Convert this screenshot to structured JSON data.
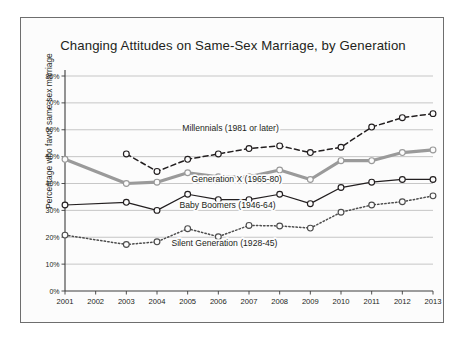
{
  "figure": {
    "title": "Changing Attitudes on Same-Sex Marriage, by Generation",
    "y_axis_title": "Percentage who favor same-sex marriage",
    "frame_color": "#6e6e6e",
    "background": "#fcfcfc"
  },
  "chart_data": {
    "type": "line",
    "title": "Changing Attitudes on Same-Sex Marriage, by Generation",
    "xlabel": "",
    "ylabel": "Percentage who favor same-sex marriage",
    "x": [
      2001,
      2002,
      2003,
      2004,
      2005,
      2006,
      2007,
      2008,
      2009,
      2010,
      2011,
      2012,
      2013
    ],
    "categories": [
      "2001",
      "2002",
      "2003",
      "2004",
      "2005",
      "2006",
      "2007",
      "2008",
      "2009",
      "2010",
      "2011",
      "2012",
      "2013"
    ],
    "ylim": [
      0,
      80
    ],
    "yticks": [
      0,
      10,
      20,
      30,
      40,
      50,
      60,
      70,
      80
    ],
    "ytick_labels": [
      "0%",
      "10%",
      "20%",
      "30%",
      "40%",
      "50%",
      "60%",
      "70%",
      "80%"
    ],
    "grid": true,
    "legend": "inline-labels",
    "series": [
      {
        "name": "Millennials  (1981 or later)",
        "label": "Millennials  (1981 or later)",
        "color": "#231f20",
        "style": "dashed",
        "x": [
          2003,
          2004,
          2005,
          2006,
          2007,
          2008,
          2009,
          2010,
          2011,
          2012,
          2013
        ],
        "values": [
          51,
          44.5,
          49,
          51,
          53,
          54,
          51.5,
          53.5,
          61,
          64.5,
          66
        ],
        "label_x": 2006.4,
        "label_y": 59.5
      },
      {
        "name": "Generation X (1965-80)",
        "label": "Generation X (1965-80)",
        "color": "#9a9a9a",
        "style": "solid-thick",
        "x": [
          2001,
          2003,
          2004,
          2005,
          2006,
          2007,
          2008,
          2009,
          2010,
          2011,
          2012,
          2013
        ],
        "values": [
          49,
          40,
          40.5,
          44,
          42.5,
          42.5,
          45,
          41.5,
          48.5,
          48.5,
          51.5,
          52.5
        ],
        "label_x": 2006.6,
        "label_y": 40.6
      },
      {
        "name": "Baby Boomers (1946-64)",
        "label": "Baby Boomers (1946-64)",
        "color": "#231f20",
        "style": "solid-thin",
        "x": [
          2001,
          2003,
          2004,
          2005,
          2006,
          2007,
          2008,
          2009,
          2010,
          2011,
          2012,
          2013
        ],
        "values": [
          32,
          33,
          30,
          36,
          34,
          34,
          36,
          32.5,
          38.5,
          40.5,
          41.5,
          41.5
        ],
        "label_x": 2006.3,
        "label_y": 30.9
      },
      {
        "name": "Silent Generation (1928-45)",
        "label": "Silent Generation (1928-45)",
        "color": "#4d4d4d",
        "style": "dotted",
        "x": [
          2001,
          2003,
          2004,
          2005,
          2006,
          2007,
          2008,
          2009,
          2010,
          2011,
          2012,
          2013
        ],
        "values": [
          20.8,
          17.3,
          18.3,
          23.2,
          20.2,
          24.4,
          24.2,
          23.4,
          29.3,
          32,
          33.2,
          35.4
        ],
        "label_x": 2006.2,
        "label_y": 16.6
      }
    ]
  }
}
